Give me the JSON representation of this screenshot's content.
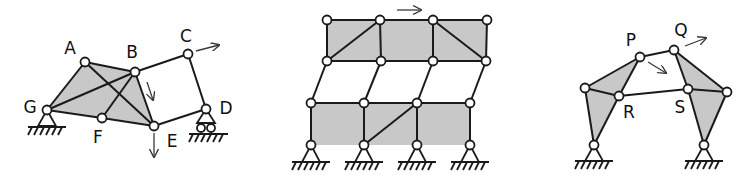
{
  "colors": {
    "fill": "#c8c8c8",
    "stroke": "#1a1a1a",
    "arrow": "#3a3a3a",
    "node_fill": "#ffffff"
  },
  "diagrams": [
    {
      "id": "mechanism-1",
      "labels": [
        {
          "text": "A",
          "x": 70,
          "y": 48
        },
        {
          "text": "B",
          "x": 132,
          "y": 52
        },
        {
          "text": "C",
          "x": 186,
          "y": 36
        },
        {
          "text": "D",
          "x": 226,
          "y": 108
        },
        {
          "text": "E",
          "x": 172,
          "y": 141
        },
        {
          "text": "F",
          "x": 98,
          "y": 137
        },
        {
          "text": "G",
          "x": 30,
          "y": 107
        }
      ],
      "nodes": {
        "A": [
          85,
          62
        ],
        "B": [
          135,
          72
        ],
        "C": [
          188,
          54
        ],
        "D": [
          206,
          109
        ],
        "E": [
          154,
          126
        ],
        "F": [
          102,
          118
        ],
        "G": [
          47,
          110
        ]
      }
    },
    {
      "id": "frame-2",
      "labels": []
    },
    {
      "id": "mechanism-3",
      "labels": [
        {
          "text": "P",
          "x": 631,
          "y": 40
        },
        {
          "text": "Q",
          "x": 681,
          "y": 30
        },
        {
          "text": "R",
          "x": 629,
          "y": 112
        },
        {
          "text": "S",
          "x": 680,
          "y": 107
        }
      ]
    }
  ]
}
